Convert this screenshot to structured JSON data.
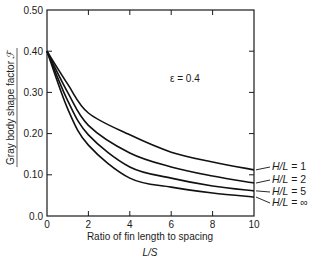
{
  "chart_data": {
    "type": "line",
    "title": "",
    "xlabel": "Ratio of fin length to spacing",
    "xlabel_symbol": "L/S",
    "ylabel": "Gray body shape factor",
    "ylabel_symbol": "ℱ",
    "annotation": "ε = 0.4",
    "xlim": [
      0,
      10
    ],
    "ylim": [
      0,
      0.5
    ],
    "xticks": [
      0,
      2,
      4,
      6,
      8,
      10
    ],
    "xtick_labels": [
      "0",
      "2",
      "4",
      "6",
      "8",
      "10"
    ],
    "yticks": [
      0,
      0.1,
      0.2,
      0.3,
      0.4,
      0.5
    ],
    "ytick_labels": [
      "0.0",
      "0.10",
      "0.20",
      "0.30",
      "0.40",
      "0.50"
    ],
    "grid": false,
    "legend_position": "right, inline labels at curve ends",
    "x": [
      0,
      1,
      2,
      4,
      6,
      8,
      10
    ],
    "series": [
      {
        "name": "H/L = 1",
        "values": [
          0.4,
          0.32,
          0.25,
          0.197,
          0.155,
          0.131,
          0.112
        ]
      },
      {
        "name": "H/L = 2",
        "values": [
          0.4,
          0.3,
          0.22,
          0.153,
          0.119,
          0.097,
          0.08
        ]
      },
      {
        "name": "H/L = 5",
        "values": [
          0.4,
          0.28,
          0.197,
          0.119,
          0.092,
          0.073,
          0.061
        ]
      },
      {
        "name": "H/L = ∞",
        "values": [
          0.4,
          0.26,
          0.172,
          0.092,
          0.07,
          0.056,
          0.046
        ]
      }
    ]
  }
}
